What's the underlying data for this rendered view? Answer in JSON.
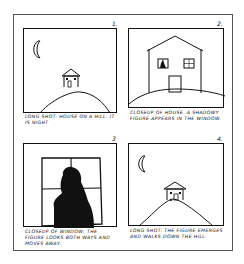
{
  "storyboard": {
    "panels": [
      {
        "number": "1.",
        "shot": "long-shot",
        "caption": "LONG SHOT: HOUSE ON A HILL. IT IS NIGHT"
      },
      {
        "number": "2.",
        "shot": "closeup",
        "caption": "CLOSEUP OF HOUSE. A SHADOWY FIGURE APPEARS IN THE WINDOW."
      },
      {
        "number": "3",
        "shot": "closeup",
        "caption": "CLOSEUP OF WINDOW; THE FIGURE LOOKS BOTH WAYS AND MOVES AWAY."
      },
      {
        "number": "4.",
        "shot": "long-shot",
        "caption": "LONG SHOT: THE FIGURE EMERGES AND WALKS DOWN THE HILL."
      }
    ],
    "colors": {
      "ink": "#111111",
      "paper": "#ffffff",
      "frame": "#555555"
    }
  }
}
